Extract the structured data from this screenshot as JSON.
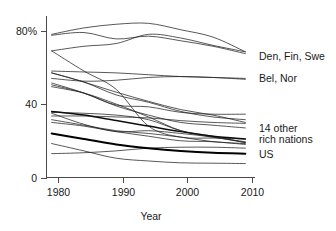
{
  "chart_data": {
    "type": "line",
    "title": "",
    "subtitle": "",
    "xlabel": "Year",
    "ylabel": "",
    "xlim": [
      1978.2,
      2010.5
    ],
    "ylim": [
      0,
      88
    ],
    "xticks": [
      1980,
      1990,
      2000,
      2010
    ],
    "xtick_labels": [
      "1980",
      "1990",
      "2000",
      "2010"
    ],
    "yticks": [
      0,
      40,
      80
    ],
    "ytick_labels": [
      "0",
      "40",
      "80%"
    ],
    "grid": false,
    "legend": "right-annotations",
    "annotations": [
      {
        "id": "den-fin-swe",
        "text": "Den, Fin, Swe",
        "x": 2010.4,
        "y": 66
      },
      {
        "id": "bel-nor",
        "text": "Bel, Nor",
        "x": 2010.4,
        "y": 54
      },
      {
        "id": "14-other-rich-nations-1",
        "text": "14 other",
        "x": 2010.4,
        "y": 27
      },
      {
        "id": "14-other-rich-nations-2",
        "text": "rich nations",
        "x": 2010.4,
        "y": 21
      },
      {
        "id": "us",
        "text": "US",
        "x": 2010.4,
        "y": 13
      }
    ],
    "x": [
      1979,
      1984,
      1989,
      1994,
      1999,
      2004,
      2009
    ],
    "series": [
      {
        "name": "Sweden",
        "group": "Den, Fin, Swe",
        "emphasis": "normal",
        "values": [
          78.0,
          81.5,
          83.5,
          84.0,
          80.5,
          76.5,
          68.5
        ]
      },
      {
        "name": "Denmark",
        "group": "Den, Fin, Swe",
        "emphasis": "normal",
        "values": [
          77.5,
          79.0,
          75.5,
          77.0,
          74.5,
          71.5,
          67.5
        ]
      },
      {
        "name": "Finland",
        "group": "Den, Fin, Swe",
        "emphasis": "normal",
        "values": [
          69.0,
          71.5,
          73.0,
          78.0,
          76.0,
          72.0,
          68.5
        ]
      },
      {
        "name": "Belgium",
        "group": "Bel, Nor",
        "emphasis": "normal",
        "values": [
          54.0,
          52.5,
          53.0,
          54.5,
          55.0,
          54.5,
          53.5
        ]
      },
      {
        "name": "Norway",
        "group": "Bel, Nor",
        "emphasis": "normal",
        "values": [
          58.0,
          57.5,
          57.0,
          56.0,
          55.0,
          54.5,
          54.0
        ]
      },
      {
        "name": "Austria",
        "group": "other",
        "emphasis": "normal",
        "values": [
          57.0,
          52.0,
          46.5,
          41.5,
          37.0,
          34.0,
          30.0
        ]
      },
      {
        "name": "Italy",
        "group": "other",
        "emphasis": "normal",
        "values": [
          50.5,
          46.0,
          39.5,
          38.5,
          35.5,
          34.5,
          34.5
        ]
      },
      {
        "name": "United Kingdom",
        "group": "other",
        "emphasis": "normal",
        "values": [
          51.5,
          46.0,
          39.0,
          34.0,
          30.0,
          28.5,
          27.0
        ]
      },
      {
        "name": "Ireland",
        "group": "other",
        "emphasis": "normal",
        "values": [
          57.0,
          52.0,
          45.0,
          41.0,
          36.0,
          33.0,
          31.5
        ]
      },
      {
        "name": "Australia",
        "group": "other",
        "emphasis": "normal",
        "values": [
          49.5,
          46.0,
          40.0,
          33.0,
          25.5,
          22.0,
          19.5
        ]
      },
      {
        "name": "New Zealand",
        "group": "other",
        "emphasis": "normal",
        "values": [
          69.0,
          58.0,
          48.0,
          28.0,
          22.0,
          21.5,
          21.0
        ]
      },
      {
        "name": "Germany",
        "group": "other",
        "emphasis": "normal",
        "values": [
          35.5,
          35.0,
          34.0,
          31.5,
          25.5,
          22.5,
          19.0
        ]
      },
      {
        "name": "Netherlands",
        "group": "other",
        "emphasis": "normal",
        "values": [
          35.0,
          29.0,
          25.0,
          25.5,
          24.0,
          22.0,
          19.0
        ]
      },
      {
        "name": "Canada",
        "group": "other",
        "emphasis": "normal",
        "values": [
          33.5,
          33.5,
          33.0,
          32.5,
          31.0,
          30.0,
          29.5
        ]
      },
      {
        "name": "Japan",
        "group": "other",
        "emphasis": "normal",
        "values": [
          31.5,
          28.5,
          25.5,
          24.0,
          22.0,
          19.5,
          18.5
        ]
      },
      {
        "name": "Switzerland",
        "group": "other",
        "emphasis": "normal",
        "values": [
          30.0,
          28.0,
          25.0,
          22.5,
          20.0,
          19.5,
          18.0
        ]
      },
      {
        "name": "France",
        "group": "other",
        "emphasis": "normal",
        "values": [
          18.5,
          14.5,
          10.5,
          9.0,
          8.0,
          7.8,
          7.6
        ]
      },
      {
        "name": "Spain",
        "group": "other",
        "emphasis": "normal",
        "values": [
          13.0,
          13.5,
          14.5,
          16.0,
          16.5,
          16.5,
          16.0
        ]
      },
      {
        "name": "14 other rich nations",
        "group": "average",
        "emphasis": "semibold",
        "values": [
          36.0,
          34.0,
          31.0,
          28.0,
          25.0,
          22.5,
          21.0
        ]
      },
      {
        "name": "US",
        "group": "us",
        "emphasis": "bold",
        "values": [
          24.0,
          21.0,
          18.0,
          16.0,
          14.5,
          13.5,
          13.0
        ]
      }
    ]
  },
  "axes": {
    "x_title": "Year",
    "y_title": ""
  }
}
